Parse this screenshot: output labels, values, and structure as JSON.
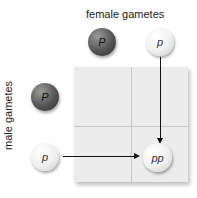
{
  "labels": {
    "female": "female gametes",
    "male": "male gametes"
  },
  "female_gametes": [
    {
      "allele": "P",
      "shade": "dark"
    },
    {
      "allele": "p",
      "shade": "light"
    }
  ],
  "male_gametes": [
    {
      "allele": "P",
      "shade": "dark"
    },
    {
      "allele": "p",
      "shade": "light"
    }
  ],
  "offspring": {
    "genotype": "pp",
    "shade": "light"
  },
  "colors": {
    "grid": "#ececec",
    "dark_ball": "#555555",
    "light_ball": "#f0f0f0",
    "arrow": "#111111"
  }
}
